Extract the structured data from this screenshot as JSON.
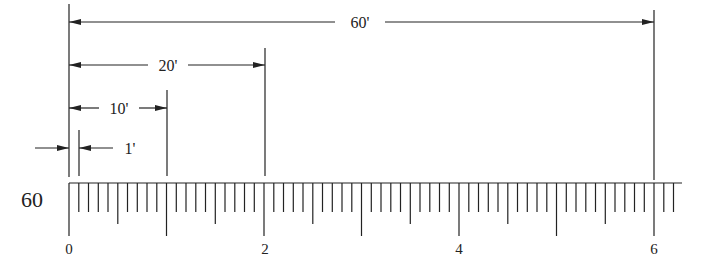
{
  "scale": {
    "label": "60",
    "ticks_per_unit": 10,
    "unit_labels": [
      "0",
      "2",
      "4",
      "6"
    ],
    "unit_label_values": [
      0,
      2,
      4,
      6
    ],
    "max_ticks": 62
  },
  "dimensions": [
    {
      "label": "60'",
      "from": 0,
      "to": 6
    },
    {
      "label": "20'",
      "from": 0,
      "to": 2
    },
    {
      "label": "10'",
      "from": 0,
      "to": 1
    },
    {
      "label": "1'",
      "from": 0,
      "to": 0.1
    }
  ],
  "colors": {
    "line": "#222222",
    "background": "#ffffff"
  }
}
